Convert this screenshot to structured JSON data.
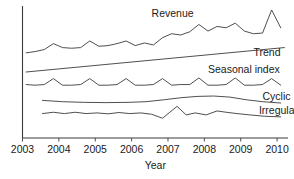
{
  "chart_data": {
    "type": "line",
    "title": "",
    "xlabel": "Year",
    "ylabel": "",
    "grid": false,
    "legend_position": "inline-right",
    "xlim": [
      2003,
      2010.3
    ],
    "ylim": [
      0,
      100
    ],
    "axis_ticks_y": [],
    "xtick_labels": [
      "2003",
      "2004",
      "2005",
      "2006",
      "2007",
      "2008",
      "2009",
      "2010"
    ],
    "xtick_values": [
      2003,
      2004,
      2005,
      2006,
      2007,
      2008,
      2009,
      2010
    ],
    "annotations": [
      {
        "text": "Revenue",
        "x": 2006.55,
        "y": 92
      },
      {
        "text": "Trend",
        "x": 2009.35,
        "y": 62
      },
      {
        "text": "Seasonal index",
        "x": 2008.1,
        "y": 49
      },
      {
        "text": "Cyclic",
        "x": 2009.6,
        "y": 29
      },
      {
        "text": "Irregular",
        "x": 2009.5,
        "y": 18
      }
    ],
    "series": [
      {
        "name": "Revenue",
        "label": "Revenue",
        "color": "#3b3b3b",
        "x": [
          2003.1,
          2003.35,
          2003.6,
          2003.85,
          2004.1,
          2004.35,
          2004.6,
          2004.85,
          2005.1,
          2005.35,
          2005.6,
          2005.85,
          2006.1,
          2006.35,
          2006.6,
          2006.85,
          2007.1,
          2007.35,
          2007.6,
          2007.85,
          2008.1,
          2008.35,
          2008.6,
          2008.85,
          2009.1,
          2009.35,
          2009.6,
          2009.85,
          2010.1
        ],
        "values": [
          64.5,
          65.5,
          67.0,
          71.5,
          68.5,
          68.0,
          68.5,
          73.5,
          69.5,
          70.0,
          71.5,
          73.5,
          70.0,
          72.0,
          70.5,
          76.0,
          79.0,
          78.0,
          80.5,
          86.0,
          81.0,
          84.5,
          83.5,
          87.0,
          81.0,
          79.0,
          79.5,
          97.0,
          83.5
        ]
      },
      {
        "name": "Trend",
        "label": "Trend",
        "color": "#3b3b3b",
        "x": [
          2003.1,
          2010.2
        ],
        "values": [
          50.0,
          68.5
        ]
      },
      {
        "name": "Seasonal index",
        "label": "Seasonal index",
        "color": "#3b3b3b",
        "x": [
          2003.1,
          2003.35,
          2003.6,
          2003.85,
          2004.1,
          2004.35,
          2004.6,
          2004.85,
          2005.1,
          2005.35,
          2005.6,
          2005.85,
          2006.1,
          2006.35,
          2006.6,
          2006.85,
          2007.1,
          2007.35,
          2007.6,
          2007.85,
          2008.1,
          2008.35,
          2008.6,
          2008.85,
          2009.1,
          2009.35,
          2009.6,
          2009.85,
          2010.1
        ],
        "values": [
          40.5,
          40.0,
          40.5,
          45.0,
          40.0,
          40.0,
          40.5,
          45.0,
          40.0,
          40.0,
          40.5,
          45.0,
          40.0,
          40.0,
          40.5,
          45.0,
          40.0,
          40.5,
          40.5,
          45.5,
          40.0,
          40.0,
          40.5,
          45.5,
          40.0,
          40.0,
          40.5,
          45.0,
          40.0
        ]
      },
      {
        "name": "Cyclic",
        "label": "Cyclic",
        "color": "#3b3b3b",
        "x": [
          2003.55,
          2004.1,
          2004.7,
          2005.3,
          2005.9,
          2006.4,
          2006.9,
          2007.35,
          2007.8,
          2008.25,
          2008.7,
          2009.15,
          2009.6,
          2010.1
        ],
        "values": [
          28.5,
          27.5,
          27.0,
          26.8,
          27.0,
          27.5,
          29.0,
          30.5,
          31.5,
          31.8,
          31.0,
          29.0,
          27.5,
          26.5
        ]
      },
      {
        "name": "Irregular",
        "label": "Irregular",
        "color": "#3b3b3b",
        "x": [
          2003.55,
          2003.85,
          2004.15,
          2004.45,
          2004.75,
          2005.05,
          2005.35,
          2005.65,
          2005.95,
          2006.25,
          2006.55,
          2006.85,
          2007.05,
          2007.25,
          2007.5,
          2007.75,
          2008.05,
          2008.35,
          2008.6,
          2008.9,
          2009.25,
          2009.65,
          2010.1
        ],
        "values": [
          18.5,
          19.5,
          18.5,
          19.5,
          18.5,
          19.0,
          18.3,
          19.3,
          18.5,
          19.0,
          18.0,
          15.0,
          19.5,
          24.0,
          17.5,
          19.0,
          17.5,
          20.5,
          19.5,
          18.5,
          17.5,
          16.5,
          16.0
        ]
      }
    ]
  }
}
